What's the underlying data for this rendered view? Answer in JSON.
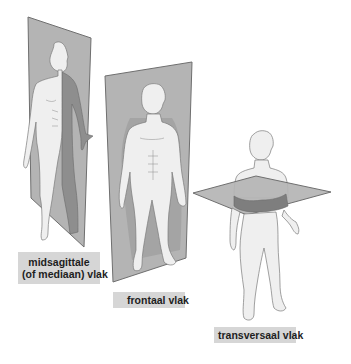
{
  "figure": {
    "colors": {
      "background": "#ffffff",
      "plane_fill": "#b3b3b3",
      "plane_edge": "#6f6f6f",
      "body_fill": "#efefef",
      "body_outline": "#7a7a7a",
      "shadow_fill": "#8e8e8e",
      "label_bg": "#d6d6d6",
      "label_text": "#1e1e1e"
    },
    "planes": [
      {
        "id": "sagittal",
        "label_line1": "midsagittale",
        "label_line2": "(of mediaan) vlak"
      },
      {
        "id": "frontal",
        "label": "frontaal vlak"
      },
      {
        "id": "transversal",
        "label": "transversaal vlak"
      }
    ]
  }
}
